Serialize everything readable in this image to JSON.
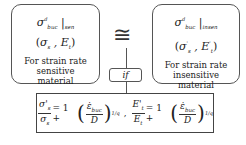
{
  "left_box": {
    "symbol": "σ",
    "symbol_sup": "d",
    "symbol_sub": "buc",
    "symbol_tail": "|",
    "symbol_tail_sub": "sen",
    "pair": "(σ_s , E_t)",
    "pair_a": "σ",
    "pair_a_sub": "s",
    "pair_b": "E",
    "pair_b_sub": "t",
    "description": [
      "For strain rate",
      "sensitive",
      "material"
    ]
  },
  "right_box": {
    "symbol": "σ",
    "symbol_sup": "d",
    "symbol_sub": "buc",
    "symbol_tail": "|",
    "symbol_tail_sub": "insen",
    "pair_a": "σ",
    "pair_a_sup": "'",
    "pair_a_sub": "s",
    "pair_b": "E",
    "pair_b_sup": "'",
    "pair_b_sub": "t",
    "description": [
      "For strain rate",
      "insensitive",
      "material"
    ]
  },
  "connector": {
    "approx_symbol": "≅",
    "condition_label": "if"
  },
  "equation": {
    "eq1_num": "σ'",
    "eq1_num_sub": "s",
    "eq1_den": "σ",
    "eq1_den_sub": "s",
    "rhs_one": "= 1 +",
    "rate_num": "ε̇",
    "rate_num_sub": "buc",
    "rate_den": "D",
    "exponent": "1/q",
    "separator": ",",
    "eq2_num": "E'",
    "eq2_num_sub": "t",
    "eq2_den": "E",
    "eq2_den_sub": "t"
  }
}
